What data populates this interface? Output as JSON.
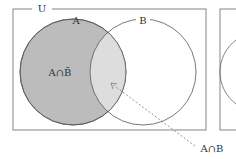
{
  "diagram": {
    "type": "venn",
    "universe_label": "U",
    "set_a_label": "A",
    "set_b_label": "B",
    "region_a_not_b_label": "A∩B̄",
    "region_a_and_b_label": "A∩B",
    "colors": {
      "a_only_fill": "#bcbcbc",
      "intersection_fill": "#dddddd",
      "outline": "#555555",
      "background": "#ffffff"
    }
  }
}
